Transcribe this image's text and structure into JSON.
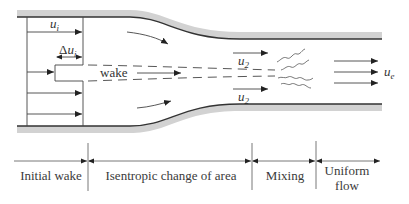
{
  "diagram": {
    "title": "",
    "colors": {
      "wall_fill": "#d2d2d2",
      "wall_edge": "#333333",
      "line": "#444444",
      "text": "#333333",
      "background": "#ffffff"
    },
    "flow_labels": {
      "initial_velocity": {
        "base": "u",
        "sub": "i"
      },
      "velocity_deficit": {
        "prefix": "Δ",
        "base": "u",
        "sub": "i"
      },
      "wake": "wake",
      "upper_velocity": {
        "base": "u",
        "sub": "2"
      },
      "lower_velocity": {
        "base": "u",
        "sub": "2"
      },
      "exit_velocity": {
        "base": "u",
        "sub": "e"
      }
    },
    "regions": [
      {
        "label": "Initial wake"
      },
      {
        "label": "Isentropic change of area"
      },
      {
        "label": "Mixing"
      },
      {
        "label_line1": "Uniform",
        "label_line2": "flow"
      }
    ]
  }
}
